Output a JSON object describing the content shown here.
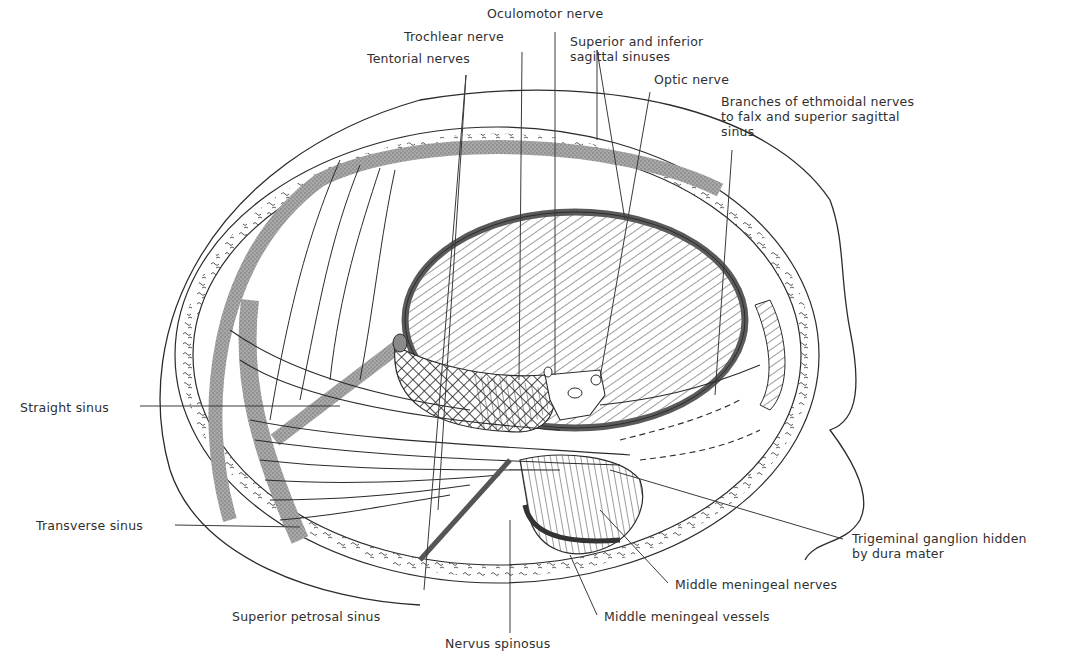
{
  "figure": {
    "colors": {
      "ink": "#2b2b2b",
      "sinus_fill": "#9a9a9a",
      "background": "#ffffff"
    },
    "labels": [
      {
        "id": "oculomotor",
        "text": "Oculomotor nerve",
        "x": 487,
        "y": 6
      },
      {
        "id": "trochlear",
        "text": "Trochlear nerve",
        "x": 404,
        "y": 29
      },
      {
        "id": "sagittal-sinuses",
        "text": "Superior and inferior\nsagittal sinuses",
        "x": 570,
        "y": 34
      },
      {
        "id": "tentorial",
        "text": "Tentorial nerves",
        "x": 367,
        "y": 51
      },
      {
        "id": "optic",
        "text": "Optic nerve",
        "x": 654,
        "y": 72
      },
      {
        "id": "ethmoidal",
        "text": "Branches of ethmoidal nerves\nto falx and superior sagittal\nsinus",
        "x": 721,
        "y": 94
      },
      {
        "id": "straight-sinus",
        "text": "Straight sinus",
        "x": 20,
        "y": 400
      },
      {
        "id": "transverse-sinus",
        "text": "Transverse sinus",
        "x": 36,
        "y": 518
      },
      {
        "id": "trigeminal",
        "text": "Trigeminal ganglion hidden\nby dura mater",
        "x": 852,
        "y": 531
      },
      {
        "id": "mm-nerves",
        "text": "Middle meningeal nerves",
        "x": 675,
        "y": 577
      },
      {
        "id": "sup-petrosal",
        "text": "Superior petrosal sinus",
        "x": 232,
        "y": 609
      },
      {
        "id": "mm-vessels",
        "text": "Middle meningeal vessels",
        "x": 604,
        "y": 609
      },
      {
        "id": "spinosus",
        "text": "Nervus spinosus",
        "x": 445,
        "y": 636
      }
    ]
  }
}
